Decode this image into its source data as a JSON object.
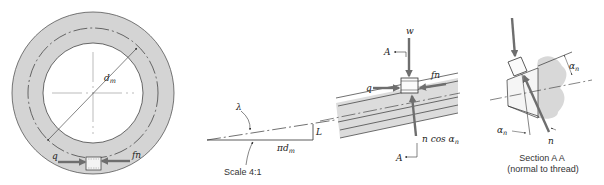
{
  "figure": {
    "panels": [
      {
        "id": "end-view",
        "description": "End view of screw thread ring with mean diameter",
        "labels": {
          "diameter": "d",
          "diameter_sub": "m",
          "force_left": "q",
          "force_right": "fn"
        }
      },
      {
        "id": "lead-triangle",
        "description": "Unrolled thread lead triangle",
        "labels": {
          "angle": "λ",
          "lead": "L",
          "base_pi": "π",
          "base_d": "d",
          "base_sub": "m",
          "scale": "Scale 4:1"
        }
      },
      {
        "id": "thread-element",
        "description": "Force element on inclined thread",
        "labels": {
          "load": "w",
          "section_top": "A",
          "section_bottom": "A",
          "force_left": "q",
          "friction": "fn",
          "normal_comp": "n cos α",
          "normal_sub": "n"
        }
      },
      {
        "id": "section-aa",
        "description": "Section A-A normal to thread",
        "labels": {
          "alpha_top": "α",
          "alpha_top_sub": "n",
          "alpha_bottom": "α",
          "alpha_bottom_sub": "n",
          "normal": "n",
          "title": "Section A A",
          "subtitle": "(normal to thread)"
        }
      }
    ],
    "colors": {
      "ring_fill": "#d4d4d4",
      "thread_fill": "#dcdcdc",
      "arrow": "#6e6e6e",
      "line": "#333333"
    }
  }
}
